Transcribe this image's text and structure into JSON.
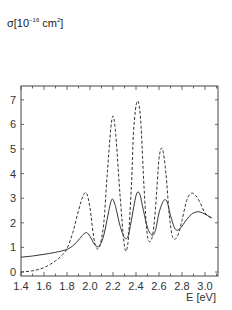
{
  "chart_data": {
    "type": "line",
    "title": "",
    "ylabel": "σ[10⁻¹⁶ cm²]",
    "ylabel_parts": {
      "prefix": "σ[10",
      "exp1": "−16",
      "mid": " cm",
      "exp2": "2",
      "suffix": "]"
    },
    "xlabel": "E [eV]",
    "xlim": [
      1.4,
      3.11
    ],
    "ylim": [
      -0.15,
      8.0
    ],
    "x_ticks": [
      "1.4",
      "1.6",
      "1.8",
      "2.0",
      "2.2",
      "2.4",
      "2.6",
      "2.8",
      "3.0"
    ],
    "y_ticks": [
      "0",
      "1",
      "2",
      "3",
      "4",
      "5",
      "6",
      "7"
    ],
    "grid": false,
    "legend": null,
    "series": [
      {
        "name": "solid",
        "style": "solid",
        "x": [
          1.4,
          1.5,
          1.6,
          1.7,
          1.8,
          1.86,
          1.9,
          1.94,
          1.97,
          2.0,
          2.04,
          2.08,
          2.12,
          2.16,
          2.19,
          2.22,
          2.26,
          2.3,
          2.33,
          2.36,
          2.4,
          2.43,
          2.46,
          2.5,
          2.54,
          2.57,
          2.6,
          2.64,
          2.67,
          2.7,
          2.74,
          2.78,
          2.82,
          2.86,
          2.9,
          2.94,
          2.98,
          3.02,
          3.06
        ],
        "y": [
          0.6,
          0.65,
          0.72,
          0.8,
          0.92,
          1.1,
          1.3,
          1.52,
          1.6,
          1.45,
          1.12,
          1.05,
          1.5,
          2.4,
          2.95,
          2.7,
          1.9,
          1.4,
          1.45,
          2.1,
          3.1,
          3.2,
          2.6,
          1.8,
          1.5,
          1.7,
          2.4,
          2.9,
          2.85,
          2.3,
          1.75,
          1.75,
          2.0,
          2.25,
          2.4,
          2.45,
          2.4,
          2.3,
          2.2
        ]
      },
      {
        "name": "dashed",
        "style": "dashed",
        "x": [
          1.4,
          1.5,
          1.6,
          1.7,
          1.76,
          1.8,
          1.85,
          1.9,
          1.94,
          1.97,
          2.0,
          2.04,
          2.08,
          2.12,
          2.15,
          2.19,
          2.22,
          2.26,
          2.3,
          2.33,
          2.36,
          2.38,
          2.41,
          2.44,
          2.47,
          2.5,
          2.54,
          2.57,
          2.6,
          2.63,
          2.66,
          2.69,
          2.72,
          2.76,
          2.8,
          2.84,
          2.88,
          2.92,
          2.96,
          3.0,
          3.05
        ],
        "y": [
          0.0,
          0.05,
          0.18,
          0.45,
          0.7,
          0.95,
          1.6,
          2.5,
          3.1,
          3.2,
          2.6,
          1.2,
          1.0,
          2.0,
          4.0,
          6.2,
          5.8,
          3.2,
          1.05,
          1.2,
          3.5,
          5.8,
          6.95,
          6.2,
          3.4,
          1.45,
          1.4,
          2.6,
          4.6,
          5.0,
          4.0,
          2.3,
          1.4,
          1.45,
          2.1,
          2.9,
          3.2,
          3.1,
          2.8,
          2.4,
          2.2
        ]
      }
    ]
  }
}
